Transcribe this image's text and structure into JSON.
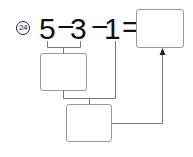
{
  "problem": {
    "number": "24",
    "tokens": [
      "5",
      "−",
      "3",
      "−",
      "1",
      "="
    ]
  },
  "boxes": {
    "answer": "",
    "step1": "",
    "step2": ""
  },
  "colors": {
    "text": "#111111",
    "box_border": "#999999",
    "lines": "#777777"
  }
}
